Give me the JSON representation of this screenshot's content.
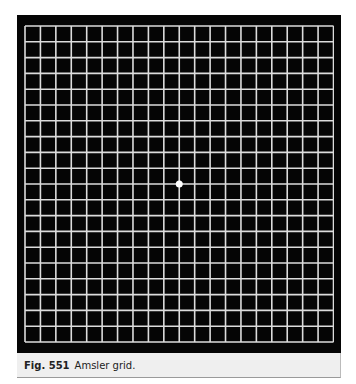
{
  "figure": {
    "label": "Fig. 551",
    "caption": "Amsler grid.",
    "background_color": "#050505",
    "line_color": "#dcdcdc",
    "grid": {
      "columns": 20,
      "rows": 20,
      "fixation_dot": {
        "column": 10,
        "row": 10,
        "color": "#ffffff"
      }
    }
  }
}
